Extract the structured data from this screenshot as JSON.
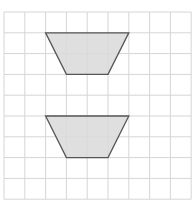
{
  "diagram": {
    "type": "grid-with-shapes",
    "grid": {
      "origin_x": 4,
      "origin_y": 12,
      "cell": 20.8,
      "cols": 9,
      "rows": 9,
      "line_color": "#d6d6d6"
    },
    "shapes": [
      {
        "name": "upper-trapezoid",
        "kind": "isosceles-trapezoid",
        "points": [
          [
            2,
            1
          ],
          [
            6,
            1
          ],
          [
            5,
            3
          ],
          [
            3,
            3
          ]
        ],
        "fill": "#d9d9d9",
        "stroke": "#555555"
      },
      {
        "name": "lower-trapezoid",
        "kind": "isosceles-trapezoid",
        "points": [
          [
            2,
            5
          ],
          [
            6,
            5
          ],
          [
            5,
            7
          ],
          [
            3,
            7
          ]
        ],
        "fill": "#d9d9d9",
        "stroke": "#555555"
      }
    ]
  }
}
